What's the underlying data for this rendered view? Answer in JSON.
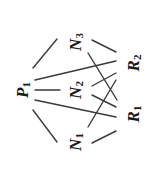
{
  "diagram": {
    "orientation": "rotated-90-ccw",
    "colors": {
      "edge": "#3a3a3a",
      "text": "#1a1a1a",
      "background": "#ffffff"
    },
    "nodes": [
      {
        "id": "P1",
        "letter": "P",
        "sub": "1",
        "x": 22,
        "y": 90
      },
      {
        "id": "N3",
        "letter": "N",
        "sub": "3",
        "x": 75,
        "y": 42
      },
      {
        "id": "N2",
        "letter": "N",
        "sub": "2",
        "x": 75,
        "y": 90
      },
      {
        "id": "N1",
        "letter": "N",
        "sub": "1",
        "x": 75,
        "y": 142
      },
      {
        "id": "R2",
        "letter": "R",
        "sub": "2",
        "x": 133,
        "y": 63
      },
      {
        "id": "R1",
        "letter": "R",
        "sub": "1",
        "x": 133,
        "y": 114
      }
    ],
    "edges": [
      {
        "from": "P1",
        "to": "N3",
        "x1": 33,
        "y1": 68,
        "x2": 57,
        "y2": 39
      },
      {
        "from": "P1",
        "to": "N2",
        "x1": 35,
        "y1": 90,
        "x2": 60,
        "y2": 90
      },
      {
        "from": "P1",
        "to": "N1",
        "x1": 33,
        "y1": 110,
        "x2": 57,
        "y2": 142
      },
      {
        "from": "P1",
        "to": "R2",
        "x1": 35,
        "y1": 80,
        "x2": 116,
        "y2": 61
      },
      {
        "from": "P1",
        "to": "R1",
        "x1": 35,
        "y1": 100,
        "x2": 116,
        "y2": 117
      },
      {
        "from": "N3",
        "to": "R2",
        "x1": 92,
        "y1": 40,
        "x2": 116,
        "y2": 52
      },
      {
        "from": "N3",
        "to": "R1",
        "x1": 88,
        "y1": 53,
        "x2": 117,
        "y2": 100
      },
      {
        "from": "N2",
        "to": "R2",
        "x1": 92,
        "y1": 86,
        "x2": 116,
        "y2": 73
      },
      {
        "from": "N2",
        "to": "R1",
        "x1": 92,
        "y1": 95,
        "x2": 116,
        "y2": 107
      },
      {
        "from": "N1",
        "to": "R2",
        "x1": 88,
        "y1": 127,
        "x2": 116,
        "y2": 80
      },
      {
        "from": "N1",
        "to": "R1",
        "x1": 92,
        "y1": 143,
        "x2": 116,
        "y2": 131
      }
    ]
  }
}
